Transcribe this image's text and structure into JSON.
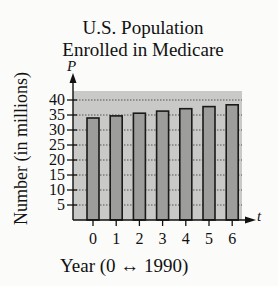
{
  "chart_data": {
    "type": "bar",
    "title_lines": [
      "U.S. Population",
      "Enrolled in Medicare"
    ],
    "xlabel": "Year (0 ↔ 1990)",
    "ylabel": "Number (in millions)",
    "x_axis_var": "t",
    "y_axis_var": "P",
    "categories": [
      "0",
      "1",
      "2",
      "3",
      "4",
      "5",
      "6"
    ],
    "values": [
      34.0,
      34.7,
      35.6,
      36.3,
      37.1,
      37.8,
      38.4
    ],
    "yticks": [
      5,
      10,
      15,
      20,
      25,
      30,
      35,
      40
    ],
    "ylim": [
      0,
      43
    ],
    "grid": true,
    "grid_style": "dotted horizontal at each y tick",
    "legend": null
  },
  "colors": {
    "background": "#fbfbfa",
    "plot_shade": "#c9c9c7",
    "bar_fill": "#9d9d9b",
    "bar_stroke": "#1a1a1a",
    "axis": "#111111",
    "grid": "#555555"
  }
}
